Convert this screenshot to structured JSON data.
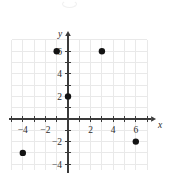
{
  "chart_data": {
    "type": "scatter",
    "title": "",
    "subtitle": "",
    "xlabel": "x",
    "ylabel": "y",
    "xlim": [
      -5,
      7
    ],
    "ylim": [
      -4.5,
      7
    ],
    "grid": true,
    "grid_step": 1,
    "legend": "none",
    "x_tick_labels": [
      "-4",
      "-2",
      "2",
      "4",
      "6"
    ],
    "x_tick_values": [
      -4,
      -2,
      2,
      4,
      6
    ],
    "y_tick_labels": [
      "6",
      "4",
      "2",
      "-2",
      "-4"
    ],
    "y_tick_values": [
      6,
      4,
      2,
      -2,
      -4
    ],
    "x_minor_ticks": [
      -5,
      -4,
      -3,
      -2,
      -1,
      1,
      2,
      3,
      4,
      5,
      6,
      7
    ],
    "y_minor_ticks": [
      -4,
      -3,
      -2,
      -1,
      1,
      2,
      3,
      4,
      5,
      6
    ],
    "points": [
      {
        "label": "point-a",
        "x": -1,
        "y": 6
      },
      {
        "label": "point-b",
        "x": 3,
        "y": 6
      },
      {
        "label": "point-c",
        "x": 0,
        "y": 2
      },
      {
        "label": "point-d",
        "x": -4,
        "y": -3
      },
      {
        "label": "point-e",
        "x": 6,
        "y": -2
      }
    ],
    "point_color": "#131313",
    "axis_color": "#3a3a3a",
    "grid_color": "#e9e9e9",
    "background_color": "#ffffff"
  },
  "figure": {
    "caption": "",
    "axis_x_name": "x",
    "axis_y_name": "y"
  }
}
